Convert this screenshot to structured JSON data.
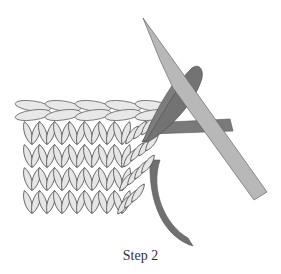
{
  "figure": {
    "caption": "Step 2",
    "colors": {
      "background": "#ffffff",
      "stitch_fill": "#e6e6e6",
      "stitch_outline": "#555555",
      "right_needle": "#b3b3b3",
      "left_needle": "#7a7a7a",
      "yarn": "#6e6e6e"
    }
  }
}
